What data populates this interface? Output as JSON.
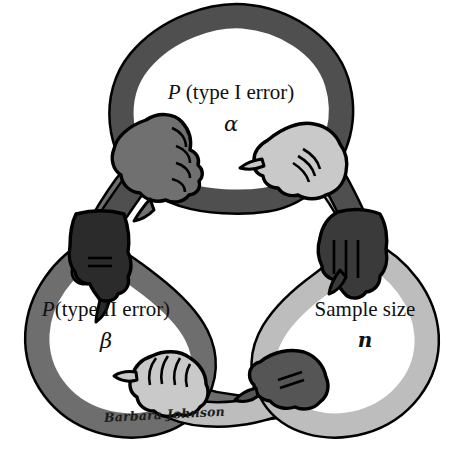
{
  "figure": {
    "background_color": "#ffffff",
    "outline_color": "#000000",
    "signature": "Barbara Johnson"
  },
  "nodes": [
    {
      "id": "alpha",
      "title_lead": "P",
      "title_rest": " (type I error)",
      "symbol": "α",
      "symbol_name": "alpha",
      "loop_color": "#5a5a5a",
      "position": "top"
    },
    {
      "id": "beta",
      "title_lead": "P",
      "title_rest": "(type II error)",
      "symbol": "β",
      "symbol_name": "beta",
      "loop_color": "#6b6b6b",
      "position": "bottom-left"
    },
    {
      "id": "sample-size",
      "title_lead": "Sample size",
      "title_rest": "",
      "symbol": "n",
      "symbol_name": "n",
      "loop_color": "#b9b9b9",
      "position": "bottom-right"
    }
  ],
  "palette": {
    "arm_dark": "#4f4f4f",
    "arm_medium": "#6e6e6e",
    "arm_light": "#bdbdbd",
    "hand_dark": "#2b2b2b",
    "hand_medium": "#707070",
    "hand_light": "#c9c9c9",
    "outline": "#000000",
    "text": "#101010",
    "background": "#ffffff"
  },
  "hands": [
    {
      "id": "hand-top-left",
      "shade": "#6e6e6e",
      "grips": "alpha-loop"
    },
    {
      "id": "hand-top-right",
      "shade": "#c9c9c9",
      "grips": "alpha-loop"
    },
    {
      "id": "hand-mid-left",
      "shade": "#2b2b2b",
      "grips": "beta-loop"
    },
    {
      "id": "hand-mid-right",
      "shade": "#3a3a3a",
      "grips": "sample-size-loop"
    },
    {
      "id": "hand-bottom-left",
      "shade": "#c9c9c9",
      "grips": "beta-loop"
    },
    {
      "id": "hand-bottom-right",
      "shade": "#555555",
      "grips": "sample-size-loop"
    }
  ]
}
